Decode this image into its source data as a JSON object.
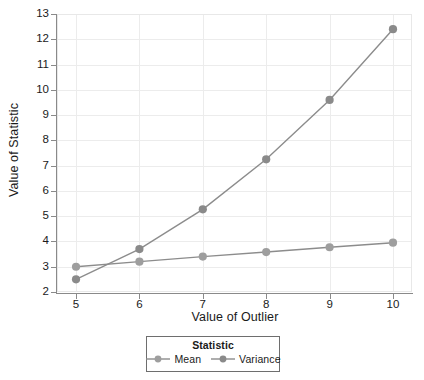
{
  "chart_data": {
    "type": "line",
    "title": "",
    "xlabel": "Value of Outlier",
    "ylabel": "Value of Statistic",
    "x": [
      5,
      6,
      7,
      8,
      9,
      10
    ],
    "xtick_labels": [
      "5",
      "6",
      "7",
      "8",
      "9",
      "10"
    ],
    "ytick_labels": [
      "2",
      "3",
      "4",
      "5",
      "6",
      "7",
      "8",
      "9",
      "10",
      "11",
      "12",
      "13"
    ],
    "yticks": [
      2,
      3,
      4,
      5,
      6,
      7,
      8,
      9,
      10,
      11,
      12,
      13
    ],
    "xlim": [
      4.7,
      10.3
    ],
    "ylim": [
      2,
      13
    ],
    "grid": true,
    "legend_position": "bottom-center",
    "legend_title": "Statistic",
    "series": [
      {
        "name": "Mean",
        "values": [
          3.0,
          3.2,
          3.4,
          3.58,
          3.77,
          3.95
        ],
        "color": "#8c8c8c",
        "marker_color": "#9e9e9e"
      },
      {
        "name": "Variance",
        "values": [
          2.5,
          3.7,
          5.27,
          7.25,
          9.6,
          12.4
        ],
        "color": "#8c8c8c",
        "marker_color": "#8a8a8a"
      }
    ]
  },
  "legend": {
    "title": "Statistic",
    "entries": [
      {
        "label": "Mean"
      },
      {
        "label": "Variance"
      }
    ]
  },
  "axes": {
    "x_title": "Value of Outlier",
    "y_title": "Value of Statistic"
  },
  "colors": {
    "series_line": "#8c8c8c",
    "mean_marker": "#9e9e9e",
    "variance_marker": "#8a8a8a",
    "gridline": "#ececec",
    "axis": "#8a8a8a",
    "text": "#1a1a1a",
    "background": "#ffffff"
  }
}
